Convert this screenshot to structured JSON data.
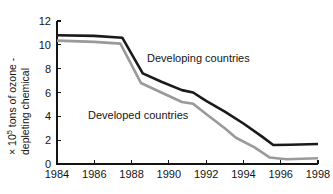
{
  "chart_data": {
    "type": "line",
    "title": "",
    "xlabel": "",
    "ylabel": "× 10⁵ tons of ozone - depleting chemical",
    "ylabel_line1": "× 10",
    "ylabel_line1_sup": "5",
    "ylabel_line1_rest": " tons of ozone -",
    "ylabel_line2": "depleting chemical",
    "xlim": [
      1984,
      1998
    ],
    "ylim": [
      0,
      12
    ],
    "xticks": [
      1984,
      1986,
      1988,
      1990,
      1992,
      1994,
      1996,
      1998
    ],
    "xtick_labels": [
      "1984",
      "1986",
      "1988",
      "1990",
      "1992",
      "1994",
      "1996",
      "1998"
    ],
    "yticks": [
      0,
      2,
      4,
      6,
      8,
      10,
      12
    ],
    "ytick_labels": [
      "0",
      "2",
      "4",
      "6",
      "8",
      "10",
      "12"
    ],
    "grid": false,
    "legend_position": "inline-annotation",
    "series": [
      {
        "name": "Developing countries",
        "color": "#1a1a1a",
        "stroke_width": 2.6,
        "annotation": "Developing countries",
        "x": [
          1984.0,
          1986.0,
          1987.5,
          1988.6,
          1989.6,
          1990.7,
          1991.3,
          1992.0,
          1993.0,
          1994.0,
          1995.0,
          1995.6,
          1996.5,
          1998.0
        ],
        "values": [
          10.8,
          10.75,
          10.6,
          7.6,
          6.9,
          6.2,
          6.0,
          5.3,
          4.4,
          3.4,
          2.3,
          1.6,
          1.62,
          1.68
        ]
      },
      {
        "name": "Developed countries",
        "color": "#9a9a9a",
        "stroke_width": 2.6,
        "annotation": "Developed countries",
        "x": [
          1984.0,
          1986.0,
          1987.4,
          1988.5,
          1989.6,
          1990.7,
          1991.3,
          1992.0,
          1993.0,
          1993.6,
          1994.6,
          1995.4,
          1996.3,
          1998.0
        ],
        "values": [
          10.35,
          10.25,
          10.1,
          6.8,
          6.0,
          5.2,
          5.05,
          4.2,
          3.0,
          2.2,
          1.4,
          0.55,
          0.4,
          0.48
        ]
      }
    ]
  },
  "plot_geometry": {
    "left": 57,
    "right": 318,
    "top": 21,
    "bottom": 164
  },
  "annotations": {
    "developing": {
      "label": "Developing countries",
      "x": 147,
      "y": 62
    },
    "developed": {
      "label": "Developed countries",
      "x": 88,
      "y": 119
    }
  },
  "colors": {
    "developing_line": "#1a1a1a",
    "developed_line": "#9a9a9a",
    "axis": "#141414",
    "background": "#ffffff",
    "text": "#141414"
  }
}
